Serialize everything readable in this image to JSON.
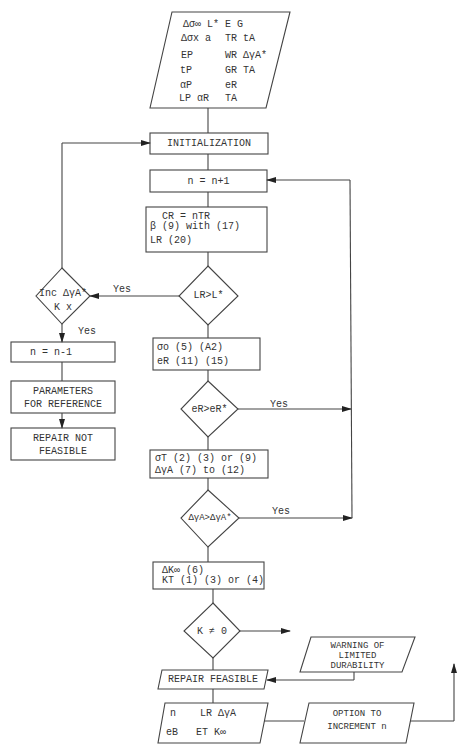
{
  "input_block": {
    "rows": [
      [
        "Δσ∞  L*",
        "E   G"
      ],
      [
        "Δσx  a",
        "TR  tA"
      ],
      [
        "EP",
        "WR  ΔγA*"
      ],
      [
        "tP",
        "GR  TA"
      ],
      [
        "αP",
        "eR"
      ],
      [
        "LP  αR",
        "     TA"
      ]
    ]
  },
  "nodes": {
    "initialization": "INITIALIZATION",
    "increment": "n = n+1",
    "compute1": {
      "line1": "CR = nTR",
      "line2": "β (9) with (17)",
      "line3": "LR  (20)"
    },
    "decision_length": "LR>L*",
    "decision_inc": {
      "line1": "Inc ΔγA*",
      "line2": "K x"
    },
    "decrement": "n = n-1",
    "parameters": {
      "line1": "PARAMETERS",
      "line2": "FOR REFERENCE"
    },
    "not_feasible": {
      "line1": "REPAIR NOT",
      "line2": "FEASIBLE"
    },
    "compute2": {
      "line1": "σo (5) (A2)",
      "line2": "eR (11) (15)"
    },
    "decision_strain": "eR>eR*",
    "compute3": {
      "line1": "σT (2) (3) or (9)",
      "line2": "ΔγA (7) to (12)"
    },
    "decision_gamma": "ΔγA>ΔγA*",
    "compute4": {
      "line1": "ΔK∞ (6)",
      "line2": "KT (1) (3) or (4)"
    },
    "decision_k": "K ≠ 0",
    "warning": {
      "line1": "WARNING OF",
      "line2": "LIMITED",
      "line3": "DURABILITY"
    },
    "feasible": "REPAIR FEASIBLE",
    "output_block": {
      "line1": "n    LR ΔγA",
      "line2": "eB   ET K∞"
    },
    "option": {
      "line1": "OPTION TO",
      "line2": "INCREMENT n"
    }
  },
  "edge_labels": {
    "yes_length": "Yes",
    "yes_inc": "Yes",
    "yes_strain": "Yes",
    "yes_gamma": "Yes"
  }
}
